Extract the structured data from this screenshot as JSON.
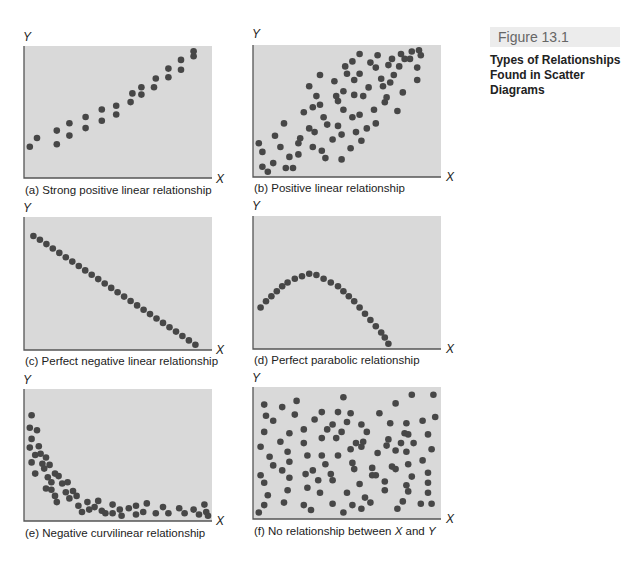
{
  "figure": {
    "number": "Figure 13.1",
    "title_line1": "Types of Relationships",
    "title_line2": "Found in Scatter Diagrams"
  },
  "colors": {
    "plot_background": "#d9d9d9",
    "axis": "#555555",
    "dot": "#474747",
    "figure_label_bg": "#ececec"
  },
  "chart_data": [
    {
      "id": "a",
      "type": "scatter",
      "title": "(a) Strong positive linear relationship",
      "xlabel": "X",
      "ylabel": "Y",
      "xlim": [
        0,
        100
      ],
      "ylim": [
        0,
        100
      ],
      "grid": false,
      "legend": null,
      "points": [
        [
          1,
          22
        ],
        [
          5,
          29
        ],
        [
          16,
          24
        ],
        [
          16,
          35
        ],
        [
          23,
          31
        ],
        [
          23,
          41
        ],
        [
          32,
          37
        ],
        [
          32,
          46
        ],
        [
          41,
          43
        ],
        [
          41,
          52
        ],
        [
          49,
          48
        ],
        [
          49,
          55
        ],
        [
          57,
          58
        ],
        [
          58,
          65
        ],
        [
          63,
          64
        ],
        [
          63,
          70
        ],
        [
          70,
          70
        ],
        [
          71,
          77
        ],
        [
          78,
          78
        ],
        [
          78,
          85
        ],
        [
          85,
          84
        ],
        [
          85,
          92
        ],
        [
          92,
          95
        ],
        [
          92,
          99
        ]
      ]
    },
    {
      "id": "b",
      "type": "scatter",
      "title": "(b) Positive linear relationship",
      "xlabel": "X",
      "ylabel": "Y",
      "xlim": [
        0,
        100
      ],
      "ylim": [
        0,
        100
      ],
      "grid": false,
      "legend": null,
      "points": [
        [
          1,
          24
        ],
        [
          3,
          5
        ],
        [
          3,
          17
        ],
        [
          6,
          1
        ],
        [
          9,
          8
        ],
        [
          10,
          30
        ],
        [
          13,
          21
        ],
        [
          15,
          40
        ],
        [
          18,
          13
        ],
        [
          16,
          4
        ],
        [
          20,
          4
        ],
        [
          23,
          24
        ],
        [
          23,
          15
        ],
        [
          24,
          28
        ],
        [
          26,
          49
        ],
        [
          29,
          36
        ],
        [
          29,
          70
        ],
        [
          31,
          21
        ],
        [
          31,
          53
        ],
        [
          33,
          62
        ],
        [
          35,
          79
        ],
        [
          32,
          33
        ],
        [
          35,
          55
        ],
        [
          37,
          45
        ],
        [
          38,
          12
        ],
        [
          39,
          39
        ],
        [
          36,
          18
        ],
        [
          42,
          27
        ],
        [
          43,
          74
        ],
        [
          44,
          62
        ],
        [
          45,
          58
        ],
        [
          45,
          38
        ],
        [
          47,
          11
        ],
        [
          47,
          31
        ],
        [
          48,
          51
        ],
        [
          48,
          66
        ],
        [
          49,
          86
        ],
        [
          50,
          80
        ],
        [
          52,
          20
        ],
        [
          53,
          90
        ],
        [
          53,
          45
        ],
        [
          54,
          75
        ],
        [
          54,
          63
        ],
        [
          55,
          33
        ],
        [
          57,
          47
        ],
        [
          57,
          80
        ],
        [
          57,
          96
        ],
        [
          58,
          26
        ],
        [
          59,
          62
        ],
        [
          61,
          36
        ],
        [
          62,
          69
        ],
        [
          63,
          89
        ],
        [
          65,
          51
        ],
        [
          66,
          85
        ],
        [
          66,
          40
        ],
        [
          67,
          95
        ],
        [
          69,
          76
        ],
        [
          70,
          70
        ],
        [
          71,
          57
        ],
        [
          72,
          61
        ],
        [
          73,
          87
        ],
        [
          74,
          73
        ],
        [
          75,
          92
        ],
        [
          76,
          79
        ],
        [
          78,
          50
        ],
        [
          79,
          86
        ],
        [
          81,
          65
        ],
        [
          80,
          96
        ],
        [
          82,
          92
        ],
        [
          85,
          92
        ],
        [
          86,
          98
        ],
        [
          89,
          75
        ],
        [
          89,
          85
        ],
        [
          90,
          99
        ],
        [
          91,
          95
        ]
      ]
    },
    {
      "id": "c",
      "type": "scatter",
      "title": "(c) Perfect negative linear relationship",
      "xlabel": "X",
      "ylabel": "Y",
      "xlim": [
        0,
        100
      ],
      "ylim": [
        0,
        100
      ],
      "grid": false,
      "legend": null,
      "points": [
        [
          3,
          88
        ],
        [
          6.6,
          85
        ],
        [
          10.2,
          81.5
        ],
        [
          13.8,
          78
        ],
        [
          17.4,
          74.5
        ],
        [
          21,
          71
        ],
        [
          24.6,
          67.5
        ],
        [
          28.2,
          64
        ],
        [
          31.8,
          60.5
        ],
        [
          35.4,
          57
        ],
        [
          39,
          53.5
        ],
        [
          42.6,
          50
        ],
        [
          46.2,
          46.5
        ],
        [
          49.8,
          43
        ],
        [
          53.4,
          39.5
        ],
        [
          57,
          36
        ],
        [
          60.6,
          32.5
        ],
        [
          64.2,
          29
        ],
        [
          67.8,
          25.5
        ],
        [
          71.4,
          22
        ],
        [
          75,
          18.5
        ],
        [
          78.6,
          15
        ],
        [
          82.2,
          11.5
        ],
        [
          85.8,
          8
        ],
        [
          89.4,
          4.5
        ],
        [
          93,
          1
        ]
      ]
    },
    {
      "id": "d",
      "type": "scatter",
      "title": "(d) Perfect parabolic relationship",
      "xlabel": "X",
      "ylabel": "Y",
      "xlim": [
        0,
        100
      ],
      "ylim": [
        0,
        100
      ],
      "grid": false,
      "legend": null,
      "points": [
        [
          2,
          30
        ],
        [
          5,
          35
        ],
        [
          8,
          39
        ],
        [
          11,
          43
        ],
        [
          14,
          47
        ],
        [
          17,
          50
        ],
        [
          21,
          53
        ],
        [
          25,
          55
        ],
        [
          29,
          57
        ],
        [
          33,
          56
        ],
        [
          37,
          53
        ],
        [
          41,
          50
        ],
        [
          45,
          47
        ],
        [
          48,
          43
        ],
        [
          51,
          39
        ],
        [
          54,
          35
        ],
        [
          57,
          30
        ],
        [
          60,
          25
        ],
        [
          63,
          20
        ],
        [
          66,
          15
        ],
        [
          69,
          10
        ],
        [
          71,
          6
        ],
        [
          73,
          1
        ]
      ]
    },
    {
      "id": "e",
      "type": "scatter",
      "title": "(e) Negative curvilinear relationship",
      "xlabel": "X",
      "ylabel": "Y",
      "xlim": [
        0,
        100
      ],
      "ylim": [
        0,
        100
      ],
      "grid": false,
      "legend": null,
      "points": [
        [
          2,
          82
        ],
        [
          1,
          72
        ],
        [
          5,
          70
        ],
        [
          2,
          63
        ],
        [
          1,
          56
        ],
        [
          6,
          57
        ],
        [
          4,
          50
        ],
        [
          7,
          51
        ],
        [
          10,
          48
        ],
        [
          2,
          44
        ],
        [
          8,
          43
        ],
        [
          12,
          42
        ],
        [
          9,
          39
        ],
        [
          4,
          35
        ],
        [
          15,
          35
        ],
        [
          11,
          32
        ],
        [
          13,
          28
        ],
        [
          10,
          23
        ],
        [
          19,
          27
        ],
        [
          17,
          33
        ],
        [
          22,
          28
        ],
        [
          21,
          20
        ],
        [
          15,
          17
        ],
        [
          13,
          22
        ],
        [
          23,
          15
        ],
        [
          25,
          21
        ],
        [
          16,
          12
        ],
        [
          27,
          17
        ],
        [
          33,
          12
        ],
        [
          28,
          9
        ],
        [
          34,
          6
        ],
        [
          37,
          8
        ],
        [
          30,
          4
        ],
        [
          41,
          5
        ],
        [
          39,
          13
        ],
        [
          43,
          3
        ],
        [
          47,
          10
        ],
        [
          52,
          1
        ],
        [
          47,
          3
        ],
        [
          60,
          2
        ],
        [
          51,
          6
        ],
        [
          56,
          7
        ],
        [
          60,
          9
        ],
        [
          64,
          4
        ],
        [
          66,
          11
        ],
        [
          71,
          3
        ],
        [
          75,
          8
        ],
        [
          78,
          3
        ],
        [
          84,
          7
        ],
        [
          87,
          3
        ],
        [
          92,
          6
        ],
        [
          95,
          2
        ],
        [
          99,
          4
        ],
        [
          98,
          10
        ],
        [
          100,
          1
        ]
      ]
    },
    {
      "id": "f",
      "type": "scatter",
      "title": "(f) No relationship between X and Y",
      "xlabel": "X",
      "ylabel": "Y",
      "xlim": [
        0,
        100
      ],
      "ylim": [
        0,
        100
      ],
      "grid": false,
      "legend": null,
      "points": [
        [
          4,
          89
        ],
        [
          14,
          87
        ],
        [
          22,
          92
        ],
        [
          48,
          95
        ],
        [
          77,
          90
        ],
        [
          86,
          97
        ],
        [
          98,
          97
        ],
        [
          5,
          80
        ],
        [
          21,
          81
        ],
        [
          36,
          83
        ],
        [
          45,
          83
        ],
        [
          52,
          82
        ],
        [
          68,
          82
        ],
        [
          9,
          76
        ],
        [
          32,
          77
        ],
        [
          42,
          73
        ],
        [
          50,
          75
        ],
        [
          58,
          73
        ],
        [
          74,
          74
        ],
        [
          83,
          74
        ],
        [
          92,
          76
        ],
        [
          99,
          79
        ],
        [
          4,
          67
        ],
        [
          18,
          66
        ],
        [
          26,
          69
        ],
        [
          39,
          69
        ],
        [
          47,
          67
        ],
        [
          61,
          67
        ],
        [
          73,
          61
        ],
        [
          82,
          66
        ],
        [
          84,
          65
        ],
        [
          95,
          65
        ],
        [
          2,
          55
        ],
        [
          13,
          59
        ],
        [
          26,
          58
        ],
        [
          36,
          62
        ],
        [
          44,
          62
        ],
        [
          55,
          58
        ],
        [
          59,
          59
        ],
        [
          72,
          56
        ],
        [
          80,
          58
        ],
        [
          87,
          58
        ],
        [
          7,
          47
        ],
        [
          17,
          51
        ],
        [
          28,
          48
        ],
        [
          36,
          48
        ],
        [
          45,
          48
        ],
        [
          52,
          53
        ],
        [
          58,
          55
        ],
        [
          67,
          50
        ],
        [
          77,
          52
        ],
        [
          83,
          51
        ],
        [
          97,
          53
        ],
        [
          9,
          40
        ],
        [
          18,
          43
        ],
        [
          38,
          41
        ],
        [
          53,
          42
        ],
        [
          64,
          38
        ],
        [
          75,
          39
        ],
        [
          84,
          41
        ],
        [
          92,
          44
        ],
        [
          2,
          32
        ],
        [
          14,
          36
        ],
        [
          31,
          36
        ],
        [
          41,
          33
        ],
        [
          54,
          37
        ],
        [
          66,
          32
        ],
        [
          77,
          37
        ],
        [
          86,
          31
        ],
        [
          95,
          34
        ],
        [
          4,
          26
        ],
        [
          18,
          30
        ],
        [
          27,
          33
        ],
        [
          34,
          28
        ],
        [
          42,
          28
        ],
        [
          57,
          25
        ],
        [
          64,
          32
        ],
        [
          71,
          27
        ],
        [
          83,
          24
        ],
        [
          95,
          26
        ],
        [
          6,
          16
        ],
        [
          17,
          20
        ],
        [
          28,
          22
        ],
        [
          35,
          18
        ],
        [
          50,
          18
        ],
        [
          60,
          14
        ],
        [
          71,
          20
        ],
        [
          84,
          19
        ],
        [
          95,
          18
        ],
        [
          4,
          8
        ],
        [
          15,
          10
        ],
        [
          26,
          8
        ],
        [
          42,
          9
        ],
        [
          53,
          8
        ],
        [
          63,
          10
        ],
        [
          81,
          11
        ],
        [
          91,
          9
        ],
        [
          97,
          9
        ],
        [
          1,
          2
        ],
        [
          30,
          4
        ],
        [
          48,
          2
        ],
        [
          58,
          5
        ],
        [
          78,
          5
        ]
      ]
    }
  ],
  "panels": {
    "a": {
      "caption": "(a) Strong positive linear relationship"
    },
    "b": {
      "caption": "(b) Positive linear relationship"
    },
    "c": {
      "caption": "(c) Perfect negative linear relationship"
    },
    "d": {
      "caption": "(d) Perfect parabolic relationship"
    },
    "e": {
      "caption": "(e) Negative curvilinear relationship"
    },
    "f": {
      "caption_prefix": "(f) No relationship between ",
      "caption_x": "X",
      "caption_and": " and ",
      "caption_y": "Y"
    }
  },
  "axes": {
    "x": "X",
    "y": "Y"
  }
}
